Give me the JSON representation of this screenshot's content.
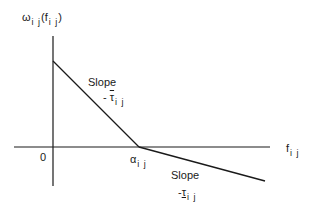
{
  "diagram": {
    "y_axis_label": {
      "main": "ω",
      "sub": "i j",
      "arg_main": "f",
      "arg_sub": "i j"
    },
    "x_axis_label": {
      "main": "f",
      "sub": "i j"
    },
    "origin_label": "0",
    "breakpoint_label": {
      "main": "α",
      "sub": "i j"
    },
    "upper_slope": {
      "title": "Slope",
      "sign": "-",
      "symbol": "τ",
      "sub": "i j",
      "decoration": "overbar"
    },
    "lower_slope": {
      "title": "Slope",
      "sign": "-",
      "symbol": "τ",
      "sub": "i j",
      "decoration": "underbar"
    },
    "colors": {
      "line": "#1a1a1a",
      "background": "#ffffff"
    }
  }
}
